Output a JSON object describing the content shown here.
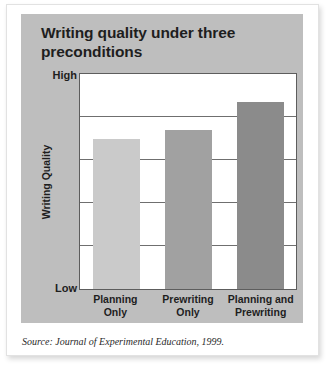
{
  "figure": {
    "title": "Writing quality under three preconditions",
    "source_prefix": "Source:",
    "source_journal": "Journal of Experimental Education",
    "source_year": ", 1999.",
    "panel_color": "#bebebe",
    "card_color": "#ffffff"
  },
  "chart_data": {
    "type": "bar",
    "title": "Writing quality under three preconditions",
    "categories": [
      "Planning Only",
      "Prewriting Only",
      "Planning and Prewriting"
    ],
    "category_lines": [
      [
        "Planning",
        "Only"
      ],
      [
        "Prewriting",
        "Only"
      ],
      [
        "Planning and",
        "Prewriting"
      ]
    ],
    "values": [
      70,
      74,
      87
    ],
    "bar_colors": [
      "#cacaca",
      "#a1a1a1",
      "#8b8b8b"
    ],
    "xlabel": "",
    "ylabel": "Writing Quality",
    "ylim": [
      0,
      100
    ],
    "ytick_labels": [
      "Low",
      "High"
    ],
    "ytick_low": "Low",
    "ytick_high": "High",
    "gridlines": [
      20,
      40,
      60,
      80
    ],
    "grid": true,
    "legend": "none",
    "plot_background": "#ffffff",
    "axis_color": "#5d5d5d"
  }
}
